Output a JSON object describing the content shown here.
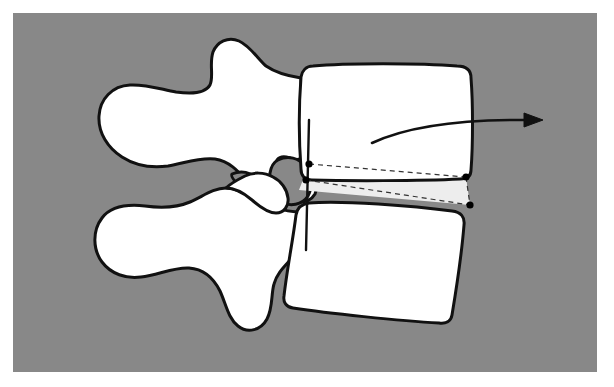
{
  "figure": {
    "kind": "anatomical-illustration",
    "caption_text": "",
    "labels": [],
    "annotation_text": ""
  },
  "canvas": {
    "width": 614,
    "height": 387,
    "page_background": "#ffffff",
    "plate_background": "#888888",
    "plate": {
      "x": 13,
      "y": 13,
      "width": 584,
      "height": 359
    }
  },
  "palette": {
    "background_gray": "#888888",
    "bone_fill": "#ffffff",
    "disc_fill": "#ededed",
    "outline_stroke": "#111111",
    "marker_fill": "#000000",
    "arrow_stroke": "#111111",
    "dashed_stroke": "#333333"
  },
  "strokes": {
    "bone_outline_width": 3.0,
    "disc_outline_width": 2.2,
    "dashed_width": 1.2,
    "dash_pattern": "5 4",
    "arrow_width": 2.6
  },
  "elements": {
    "upper_vertebral_body": {
      "name": "upper-vertebral-body",
      "path": "M 301 77 C 302 71 306 66 313 66 C 345 63 420 63 457 66 C 466 66 471 70 471 78 C 473 103 473 145 471 170 C 471 176 467 179 460 179 C 420 181 345 181 312 180 C 305 180 301 176 301 169 C 299 142 299 103 301 77 Z"
    },
    "lower_vertebral_body": {
      "name": "lower-vertebral-body",
      "path": "M 296 215 C 297 209 301 204 309 203 C 341 200 414 206 452 211 C 461 212 465 217 464 225 C 462 250 456 291 452 315 C 451 321 446 324 439 323 C 400 321 326 313 293 308 C 286 307 283 302 284 296 C 287 269 293 240 296 215 Z"
    },
    "disc_wedge": {
      "name": "intervertebral-disc-space",
      "path": "M 309 164 L 466 177 L 470 205 L 299 190 Z"
    },
    "upper_posterior_elements": {
      "name": "upper-posterior-elements",
      "path": "M 301 78 C 288 76 276 73 266 66 C 258 59 250 46 239 41 C 228 36 217 42 213 52 C 209 64 214 76 210 85 C 205 94 190 94 176 92 C 160 89 145 84 130 85 C 112 86 100 99 99 116 C 98 133 108 148 122 157 C 136 166 153 168 168 166 C 185 163 200 157 215 159 C 229 161 238 171 246 180 C 253 188 258 196 266 196 C 274 196 278 188 278 180 C 278 172 274 165 277 160 C 281 155 289 157 296 161 C 299 163 301 166 301 169 Z"
    },
    "upper_inferior_articular_lobe": {
      "name": "upper-inferior-articular-process",
      "path": "M 266 196 C 276 196 283 187 286 179 C 290 169 293 160 299 159 C 304 158 309 163 312 170 C 316 179 318 188 315 194 C 311 201 302 203 293 202 C 283 201 272 200 266 196 Z"
    },
    "lower_posterior_elements": {
      "name": "lower-posterior-elements",
      "path": "M 297 212 C 285 211 273 208 262 203 C 250 197 238 188 226 188 C 213 188 202 197 190 202 C 176 208 160 208 145 206 C 127 204 111 206 102 218 C 92 231 93 250 102 262 C 111 274 126 279 141 277 C 158 275 174 267 189 268 C 204 269 214 279 220 291 C 226 304 228 318 238 326 C 248 334 261 330 267 319 C 273 308 271 294 274 284 C 277 273 285 266 292 258 C 296 253 297 246 297 239 Z"
    },
    "lower_superior_articular_lobe": {
      "name": "lower-superior-articular-process",
      "path": "M 226 188 C 236 188 245 194 252 200 C 260 207 268 213 276 213 C 284 213 289 206 288 198 C 287 189 281 181 273 177 C 264 172 253 172 245 176 C 237 180 230 184 226 188 Z"
    },
    "facet_gap_medial": {
      "name": "facet-joint-gap-medial",
      "path": "M 232 174 C 241 170 251 172 258 179 C 266 187 270 196 267 199 C 263 202 253 198 245 191 C 237 184 230 177 232 174 Z"
    },
    "pedicle_shadow": {
      "name": "pedicle-shadow-region",
      "path": "M 278 160 C 288 155 299 158 305 166 C 312 175 313 187 308 196 C 302 205 290 207 281 202 C 272 196 268 184 270 173 C 271 167 274 162 278 160 Z"
    },
    "canal_line": {
      "name": "spinal-canal-reference-line",
      "path": "M 309 120 L 306 250"
    },
    "dashed_guides": [
      {
        "name": "disc-guide-upper",
        "path": "M 309 164 L 466 177"
      },
      {
        "name": "disc-guide-right",
        "path": "M 466 177 L 470 205"
      },
      {
        "name": "disc-guide-lower",
        "path": "M 306 180 L 470 205"
      }
    ],
    "markers": [
      {
        "name": "marker-upper-left",
        "cx": 309,
        "cy": 164,
        "r": 3.6
      },
      {
        "name": "marker-lower-left",
        "cx": 306,
        "cy": 180,
        "r": 3.6
      },
      {
        "name": "marker-upper-right",
        "cx": 466,
        "cy": 177,
        "r": 3.6
      },
      {
        "name": "marker-lower-right",
        "cx": 470,
        "cy": 205,
        "r": 3.6
      }
    ],
    "motion_arrow": {
      "name": "motion-direction-arrow",
      "shaft_path": "M 372 143 C 404 128 452 119 529 120",
      "head_points": "543,120 524,113 524,127",
      "direction": "right",
      "label": ""
    }
  }
}
